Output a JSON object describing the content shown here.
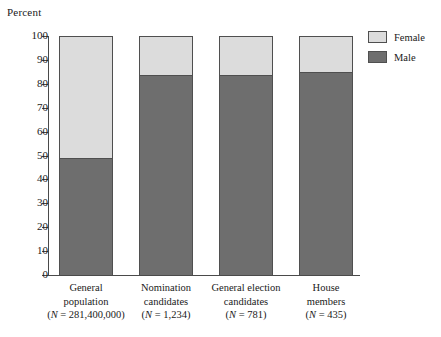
{
  "chart_data": {
    "type": "bar",
    "title": "",
    "subtitle": "",
    "ylabel": "Percent",
    "xlabel": "",
    "ylim": [
      0,
      100
    ],
    "yticks": [
      0,
      10,
      20,
      30,
      40,
      50,
      60,
      70,
      80,
      90,
      100
    ],
    "grid": false,
    "stacked": true,
    "stacked_total": 100,
    "legend_position": "right-top",
    "categories": [
      "General population",
      "Nomination candidates",
      "General election candidates",
      "House members"
    ],
    "category_labels": [
      {
        "line1": "General",
        "line2": "population",
        "line3": "(N = 281,400,000)"
      },
      {
        "line1": "Nomination",
        "line2": "candidates",
        "line3": "(N = 1,234)"
      },
      {
        "line1": "General election",
        "line2": "candidates",
        "line3": "(N = 781)"
      },
      {
        "line1": "House",
        "line2": "members",
        "line3": "(N = 435)"
      }
    ],
    "group_sizes": [
      281400000,
      1234,
      781,
      435
    ],
    "series": [
      {
        "name": "Male",
        "values": [
          49,
          83.5,
          83.5,
          85
        ],
        "color": "#6e6e6e"
      },
      {
        "name": "Female",
        "values": [
          51,
          16.5,
          16.5,
          15
        ],
        "color": "#dcdcdc"
      }
    ]
  },
  "legend": {
    "items": [
      {
        "label": "Female",
        "color": "#dcdcdc"
      },
      {
        "label": "Male",
        "color": "#6e6e6e"
      }
    ]
  },
  "colors": {
    "female": "#dcdcdc",
    "male": "#6e6e6e",
    "axis": "#4a4a4a",
    "bar_outline": "#4f4f4f",
    "background": "#ffffff",
    "text": "#1a1a1a"
  }
}
